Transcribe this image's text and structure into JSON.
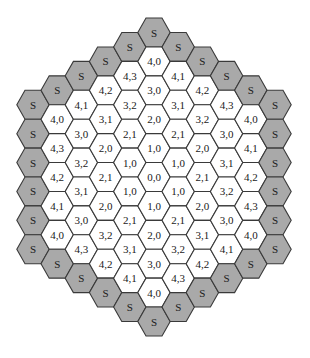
{
  "diagram": {
    "type": "hexagonal-grid",
    "shading": {
      "boundary_fill": "#a9a9a9",
      "interior_fill": "#ffffff",
      "stroke": "#3a3a3a"
    },
    "boundary_label": "S",
    "columns": [
      {
        "q": -5,
        "cells": [
          "S",
          "S",
          "S",
          "S",
          "S",
          "S"
        ]
      },
      {
        "q": -4,
        "cells": [
          "S",
          "4,0",
          "4,3",
          "4,2",
          "4,1",
          "4,0",
          "S"
        ]
      },
      {
        "q": -3,
        "cells": [
          "S",
          "4,1",
          "3,0",
          "3,2",
          "3,1",
          "3,0",
          "4,3",
          "S"
        ]
      },
      {
        "q": -2,
        "cells": [
          "S",
          "4,2",
          "3,1",
          "2,0",
          "2,1",
          "2,0",
          "3,2",
          "4,2",
          "S"
        ]
      },
      {
        "q": -1,
        "cells": [
          "S",
          "4,3",
          "3,2",
          "2,1",
          "1,0",
          "1,0",
          "2,1",
          "3,1",
          "4,1",
          "S"
        ]
      },
      {
        "q": 0,
        "cells": [
          "S",
          "4,0",
          "3,0",
          "2,0",
          "1,0",
          "0,0",
          "1,0",
          "2,0",
          "3,0",
          "4,0",
          "S"
        ]
      },
      {
        "q": 1,
        "cells": [
          "S",
          "4,1",
          "3,1",
          "2,1",
          "1,0",
          "1,0",
          "2,1",
          "3,2",
          "4,3",
          "S"
        ]
      },
      {
        "q": 2,
        "cells": [
          "S",
          "4,2",
          "3,2",
          "2,0",
          "2,1",
          "2,0",
          "3,1",
          "4,2",
          "S"
        ]
      },
      {
        "q": 3,
        "cells": [
          "S",
          "4,3",
          "3,0",
          "3,1",
          "3,2",
          "3,0",
          "4,1",
          "S"
        ]
      },
      {
        "q": 4,
        "cells": [
          "S",
          "4,0",
          "4,1",
          "4,2",
          "4,3",
          "4,0",
          "S"
        ]
      },
      {
        "q": 5,
        "cells": [
          "S",
          "S",
          "S",
          "S",
          "S",
          "S"
        ]
      }
    ]
  }
}
